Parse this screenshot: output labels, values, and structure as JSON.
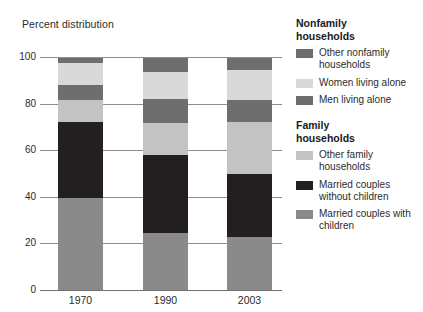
{
  "chart_data": {
    "type": "bar",
    "subtype": "stacked-100-percent",
    "title": "",
    "xlabel": "",
    "ylabel": "Percent distribution",
    "ylim": [
      0,
      100
    ],
    "yticks": [
      0,
      20,
      40,
      60,
      80,
      100
    ],
    "grid": true,
    "legend_position": "right",
    "categories": [
      "1970",
      "1990",
      "2003"
    ],
    "series": [
      {
        "name": "Married couples with children",
        "group": "Family households",
        "color": "#8a8a8a",
        "values": [
          39.5,
          24.5,
          22.7
        ]
      },
      {
        "name": "Married couples without children",
        "group": "Family households",
        "color": "#231f20",
        "values": [
          32.6,
          33.5,
          27.0
        ]
      },
      {
        "name": "Other family households",
        "group": "Family households",
        "color": "#c3c3c3",
        "values": [
          9.4,
          13.7,
          22.3
        ]
      },
      {
        "name": "Men living alone",
        "group": "Nonfamily households",
        "color": "#6e6e6e",
        "values": [
          6.4,
          10.3,
          9.4
        ]
      },
      {
        "name": "Women living alone",
        "group": "Nonfamily households",
        "color": "#d9d9d9",
        "values": [
          9.4,
          11.6,
          12.9
        ]
      },
      {
        "name": "Other nonfamily households",
        "group": "Nonfamily households",
        "color": "#6e6e6e",
        "values": [
          2.1,
          6.0,
          5.2
        ]
      }
    ]
  },
  "axis": {
    "title": "Percent distribution",
    "y_tick_labels": [
      "100",
      "80",
      "60",
      "40",
      "20",
      "0"
    ],
    "x_tick_labels": [
      "1970",
      "1990",
      "2003"
    ]
  },
  "legend": {
    "groups": [
      {
        "title": "Nonfamily\nhouseholds",
        "title_line1": "Nonfamily",
        "title_line2": "households",
        "items": [
          {
            "label": "Other nonfamily households",
            "color": "#6e6e6e"
          },
          {
            "label": "Women living alone",
            "color": "#d9d9d9"
          },
          {
            "label": "Men living alone",
            "color": "#6e6e6e"
          }
        ]
      },
      {
        "title": "Family\nhouseholds",
        "title_line1": "Family",
        "title_line2": "households",
        "items": [
          {
            "label": "Other family households",
            "color": "#c3c3c3"
          },
          {
            "label": "Married couples without children",
            "color": "#231f20"
          },
          {
            "label": "Married couples with children",
            "color": "#8a8a8a"
          }
        ]
      }
    ]
  }
}
